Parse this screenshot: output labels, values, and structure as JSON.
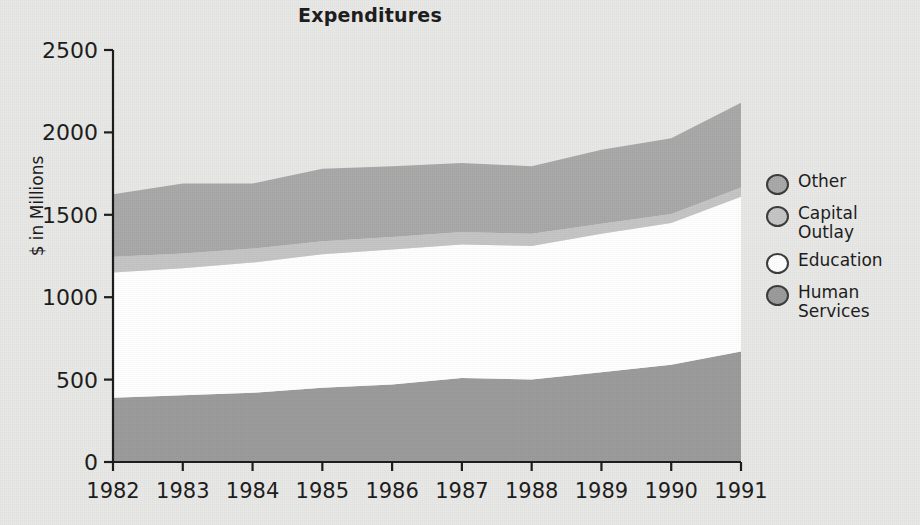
{
  "chart_data": {
    "type": "area",
    "stacked": true,
    "title": "Expenditures",
    "xlabel": "",
    "ylabel": "$ in Millions",
    "ylim": [
      0,
      2500
    ],
    "yticks": [
      0,
      500,
      1000,
      1500,
      2000,
      2500
    ],
    "grid": false,
    "legend_position": "right",
    "categories": [
      1982,
      1983,
      1984,
      1985,
      1986,
      1987,
      1988,
      1989,
      1990,
      1991
    ],
    "x_tick_labels": [
      "1982",
      "1983",
      "1984",
      "1985",
      "1986",
      "1987",
      "1988",
      "1989",
      "1990",
      "1991"
    ],
    "series": [
      {
        "name": "Human Services",
        "color": "#9a9a9a",
        "values": [
          390,
          405,
          420,
          450,
          470,
          510,
          500,
          545,
          590,
          670
        ]
      },
      {
        "name": "Education",
        "color": "#ffffff",
        "values": [
          760,
          770,
          790,
          810,
          820,
          810,
          810,
          840,
          860,
          940
        ]
      },
      {
        "name": "Capital Outlay",
        "color": "#c4c4c4",
        "values": [
          95,
          90,
          85,
          80,
          75,
          75,
          75,
          60,
          55,
          55
        ]
      },
      {
        "name": "Other",
        "color": "#a8a8a8",
        "values": [
          380,
          425,
          395,
          440,
          430,
          420,
          410,
          450,
          460,
          515
        ]
      }
    ],
    "cumulative_totals": [
      1625,
      1690,
      1690,
      1780,
      1795,
      1815,
      1795,
      1895,
      1965,
      2180
    ]
  },
  "legend": {
    "items": [
      {
        "label": "Other",
        "color": "#a8a8a8"
      },
      {
        "label": "Capital\nOutlay",
        "color": "#c4c4c4"
      },
      {
        "label": "Education",
        "color": "#ffffff"
      },
      {
        "label": "Human\nServices",
        "color": "#9a9a9a"
      }
    ]
  },
  "colors": {
    "background": "#e8e8e6",
    "axis": "#1a1a1a",
    "text": "#1a1a1a"
  }
}
